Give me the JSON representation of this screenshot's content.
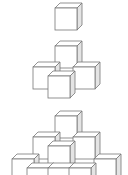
{
  "diagram": {
    "title": "",
    "cube_size": 22,
    "depth_dx": 5,
    "depth_dy": 5,
    "colors": {
      "stroke": "#777777",
      "front": "#ffffff",
      "top": "#ffffff",
      "side": "#e4e4e4"
    },
    "figures": [
      {
        "name": "figure-1",
        "cubes": [
          {
            "x": 55,
            "y": 8
          }
        ]
      },
      {
        "name": "figure-2",
        "cubes": [
          {
            "x": 55,
            "y": 46
          },
          {
            "x": 33,
            "y": 67
          },
          {
            "x": 73,
            "y": 67
          },
          {
            "x": 48,
            "y": 76
          }
        ]
      },
      {
        "name": "figure-3",
        "cubes": [
          {
            "x": 55,
            "y": 116
          },
          {
            "x": 33,
            "y": 137
          },
          {
            "x": 73,
            "y": 137
          },
          {
            "x": 48,
            "y": 146
          },
          {
            "x": 12,
            "y": 159
          },
          {
            "x": 94,
            "y": 159
          },
          {
            "x": 27,
            "y": 168
          },
          {
            "x": 48,
            "y": 168
          },
          {
            "x": 69,
            "y": 168
          }
        ]
      }
    ]
  }
}
